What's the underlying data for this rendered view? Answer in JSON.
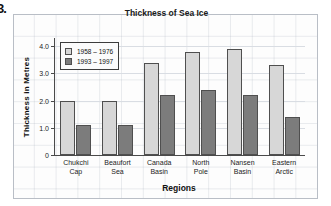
{
  "question_number": "3.",
  "chart_data": {
    "type": "bar",
    "title": "Thickness of Sea Ice",
    "xlabel": "Regions",
    "ylabel": "Thickness in Metres",
    "categories": [
      "Chukchi\nCap",
      "Beaufort\nSea",
      "Canada\nBasin",
      "North\nPole",
      "Nansen\nBasin",
      "Eastern\nArctic"
    ],
    "series": [
      {
        "name": "1958 – 1976",
        "color": "#d7d7d7",
        "values": [
          2.0,
          2.0,
          3.4,
          3.8,
          3.9,
          3.3
        ]
      },
      {
        "name": "1993 – 1997",
        "color": "#7c7c7c",
        "values": [
          1.1,
          1.1,
          2.2,
          2.4,
          2.2,
          1.4
        ]
      }
    ],
    "ylim": [
      0,
      4.3
    ],
    "yticks": [
      0,
      1.0,
      2.0,
      3.0,
      4.0
    ],
    "ytick_labels": [
      "0",
      "1.0",
      "2.0",
      "3.0",
      "4.0"
    ],
    "grid": true,
    "legend_position": "top-left"
  }
}
